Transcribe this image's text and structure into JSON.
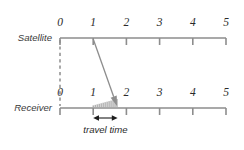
{
  "figure": {
    "background_color": "#ffffff",
    "line_color": "#8d8d8d",
    "text_color": "#2a2a2a",
    "accent_color": "#1d1d1d",
    "width": 244,
    "height": 150
  },
  "axes": [
    {
      "id": "satellite",
      "label": "Satellite",
      "label_x": 52,
      "label_y": 41,
      "axis_y": 38,
      "tick_labels": [
        "0",
        "1",
        "2",
        "3",
        "4",
        "5"
      ],
      "tick_values": [
        0,
        1,
        2,
        3,
        4,
        5
      ],
      "tick_x": [
        60,
        93.2,
        126.4,
        159.6,
        192.8,
        226
      ],
      "number_y": 26,
      "tick_length": 7,
      "tick_direction": "down"
    },
    {
      "id": "receiver",
      "label": "Receiver",
      "label_x": 52,
      "label_y": 111,
      "axis_y": 108,
      "tick_labels": [
        "0",
        "1",
        "2",
        "3",
        "4",
        "5"
      ],
      "tick_values": [
        0,
        1,
        2,
        3,
        4,
        5
      ],
      "tick_x": [
        60,
        93.2,
        126.4,
        159.6,
        192.8,
        226
      ],
      "number_y": 96,
      "tick_length": 7,
      "tick_direction": "down"
    }
  ],
  "dashed_link": {
    "name": "zero-alignment-dashed-line",
    "x": 60,
    "y1": 40,
    "y2": 106
  },
  "signal_arrow": {
    "name": "signal-travel-arrow",
    "x1": 93.2,
    "y1": 39,
    "x2": 117.0,
    "y2": 106,
    "head_size": 5.2,
    "from_time": 1,
    "to_time": 1.72
  },
  "hatch_band": {
    "name": "travel-time-hatch-band",
    "x_start": 93.2,
    "x_end": 117.0,
    "y_base": 107,
    "max_height": 8,
    "tick_count": 13
  },
  "measure": {
    "name": "travel-time-measure",
    "label": "travel time",
    "x1": 93.2,
    "x2": 117.6,
    "y": 118,
    "label_x": 105.4,
    "label_y": 133,
    "head_size": 3.4
  },
  "chart_data": {
    "type": "line",
    "xlabel": "",
    "ylabel": "",
    "xlim": [
      0,
      5
    ],
    "grid": false,
    "legend_position": "none",
    "categories": [
      "0",
      "1",
      "2",
      "3",
      "4",
      "5"
    ],
    "series": [
      {
        "name": "Satellite",
        "tick_values": [
          0,
          1,
          2,
          3,
          4,
          5
        ],
        "event_time": 1,
        "event_description": "signal transmitted at satellite clock time 1"
      },
      {
        "name": "Receiver",
        "tick_values": [
          0,
          1,
          2,
          3,
          4,
          5
        ],
        "event_time": 1.72,
        "event_description": "signal received at receiver clock time approximately 1.72"
      }
    ],
    "annotations": [
      {
        "text": "travel time",
        "from": 1,
        "to": 1.72,
        "value": 0.72,
        "axis": "Receiver"
      }
    ]
  }
}
